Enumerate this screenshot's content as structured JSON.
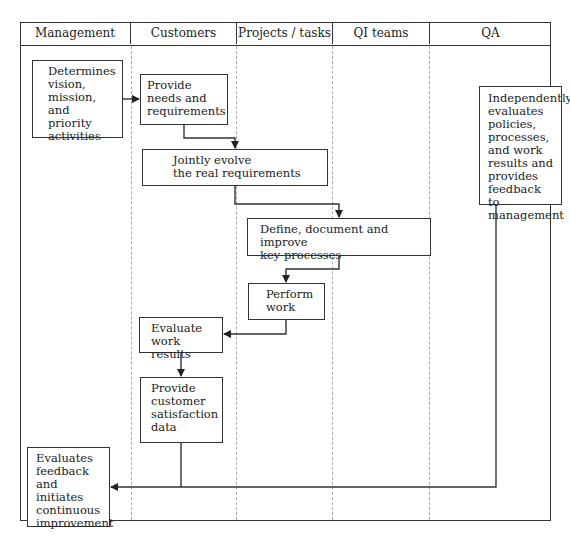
{
  "diagram": {
    "type": "swimlane-flowchart",
    "lanes": [
      {
        "id": "management",
        "label": "Management"
      },
      {
        "id": "customers",
        "label": "Customers"
      },
      {
        "id": "projects",
        "label": "Projects / tasks"
      },
      {
        "id": "qi",
        "label": "QI teams"
      },
      {
        "id": "qa",
        "label": "QA"
      }
    ],
    "nodes": {
      "determines": "Determines\nvision,\nmission, and\npriority\nactivities",
      "provide_needs": "Provide\nneeds and\nrequirements",
      "jointly_evolve": "Jointly evolve\nthe real requirements",
      "define_document": "Define, document and improve\nkey processes",
      "perform_work": "Perform\nwork",
      "evaluate_results": "Evaluate\nwork results",
      "provide_satisfaction": "Provide\ncustomer\nsatisfaction\ndata",
      "evaluates_feedback": "Evaluates\nfeedback and\ninitiates\ncontinuous\nimprovement",
      "independently_evaluates": "Independently\nevaluates\npolicies,\nprocesses,\nand work\nresults and\nprovides\nfeedback to\nmanagement"
    },
    "edges": [
      {
        "from": "determines",
        "to": "provide_needs"
      },
      {
        "from": "provide_needs",
        "to": "jointly_evolve"
      },
      {
        "from": "jointly_evolve",
        "to": "define_document"
      },
      {
        "from": "define_document",
        "to": "perform_work"
      },
      {
        "from": "perform_work",
        "to": "evaluate_results"
      },
      {
        "from": "evaluate_results",
        "to": "provide_satisfaction"
      },
      {
        "from": "provide_satisfaction",
        "to": "evaluates_feedback"
      },
      {
        "from": "independently_evaluates",
        "to": "evaluates_feedback"
      }
    ]
  }
}
